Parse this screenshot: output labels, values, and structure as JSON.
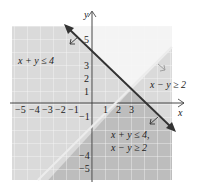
{
  "figure": {
    "axes": {
      "x_label": "x",
      "y_label": "y",
      "x_ticks": [
        "−5",
        "−4",
        "−3",
        "−2",
        "−1",
        "1",
        "2",
        "3"
      ],
      "y_ticks_pos": [
        "5",
        "3",
        "2",
        "1"
      ],
      "y_ticks_neg": [
        "−1",
        "−4",
        "−5"
      ]
    },
    "labels": {
      "region1": "x + y ≤ 4",
      "region2": "x − y ≥ 2",
      "region_both_line1": "x + y ≤ 4,",
      "region_both_line2": "x − y ≥ 2"
    },
    "colors": {
      "light_shade": "#dcdcdc",
      "dark_shade": "#bdbdbd",
      "grid": "#ffffff",
      "boundary_line": "#333333",
      "line2": "#f0f0f0",
      "axis": "#333333"
    }
  }
}
